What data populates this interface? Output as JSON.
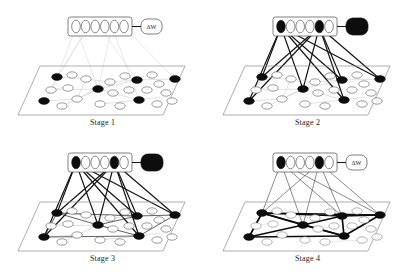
{
  "figure": {
    "background_color": "#ffffff",
    "panel_count": 4
  },
  "colors": {
    "node_fill_active": "#0d0d0d",
    "node_fill_inactive": "#ffffff",
    "node_stroke": "#3a3a3a",
    "plane_stroke": "#8d8d8d",
    "edge_faint": "#c9c9c9",
    "edge_mid": "#b0b0b0",
    "edge_bold": "#111111",
    "box_stroke": "#4a4a4a",
    "caption_color": "#1a1a1a"
  },
  "labels": {
    "delta_w": "ΔW"
  },
  "panels": [
    {
      "id": "stage-1",
      "caption": "Stage 1",
      "top_box": {
        "node_count": 6,
        "active_indices": [],
        "node_states": [
          "inactive",
          "inactive",
          "inactive",
          "inactive",
          "inactive",
          "inactive"
        ]
      },
      "delta_box": {
        "label": "ΔW",
        "filled": false,
        "show_label": true
      },
      "plane": {
        "total_nodes": 24,
        "active_nodes": 6,
        "inactive_nodes": 18,
        "edge_style": "faint"
      },
      "connections": {
        "style": "faint",
        "count": 6,
        "description": "pale gray lines from box to plane"
      }
    },
    {
      "id": "stage-2",
      "caption": "Stage 2",
      "top_box": {
        "node_count": 6,
        "active_indices": [
          0,
          4
        ],
        "node_states": [
          "active",
          "inactive",
          "inactive",
          "inactive",
          "active",
          "inactive"
        ]
      },
      "delta_box": {
        "label": "ΔW",
        "filled": true,
        "show_label": false
      },
      "plane": {
        "total_nodes": 24,
        "active_nodes": 6,
        "inactive_nodes": 18,
        "edge_style": "faint"
      },
      "connections": {
        "style": "bold",
        "count": 12,
        "description": "heavy black lines from active box nodes to active plane nodes"
      }
    },
    {
      "id": "stage-3",
      "caption": "Stage 3",
      "top_box": {
        "node_count": 6,
        "active_indices": [
          0,
          4
        ],
        "node_states": [
          "active",
          "inactive",
          "inactive",
          "inactive",
          "active",
          "inactive"
        ]
      },
      "delta_box": {
        "label": "ΔW",
        "filled": true,
        "show_label": false
      },
      "plane": {
        "total_nodes": 24,
        "active_nodes": 6,
        "inactive_nodes": 18,
        "edge_style": "mid"
      },
      "connections": {
        "style": "bold",
        "count": 12,
        "description": "heavy black lines plus emerging plane links"
      }
    },
    {
      "id": "stage-4",
      "caption": "Stage 4",
      "top_box": {
        "node_count": 6,
        "active_indices": [
          0,
          4
        ],
        "node_states": [
          "active",
          "inactive",
          "inactive",
          "inactive",
          "active",
          "inactive"
        ]
      },
      "delta_box": {
        "label": "ΔW",
        "filled": false,
        "show_label": true
      },
      "plane": {
        "total_nodes": 24,
        "active_nodes": 6,
        "inactive_nodes": 18,
        "edge_style": "bold"
      },
      "connections": {
        "style": "thin",
        "count": 8,
        "description": "thin black lines from box to plane; bold network on plane"
      }
    }
  ]
}
